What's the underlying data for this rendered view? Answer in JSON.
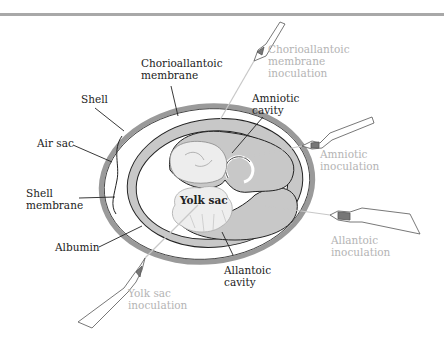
{
  "diagram": {
    "colors": {
      "shell": "#9a9a9a",
      "membrane_fill": "#c8c8c8",
      "outline": "#222222",
      "inoculation_label": "#b4b4b4",
      "structure_label": "#222222",
      "rule": "#a8a8a8"
    },
    "structure_labels": {
      "chorioallantoic_membrane": "Chorioallantoic\nmembrane",
      "shell": "Shell",
      "air_sac": "Air sac",
      "shell_membrane": "Shell\nmembrane",
      "albumin": "Albumin",
      "amniotic_cavity": "Amniotic\ncavity",
      "yolk_sac": "Yolk sac",
      "allantoic_cavity": "Allantoic\ncavity"
    },
    "inoculation_labels": {
      "chorioallantoic_membrane": "Chorioallantoic\nmembrane\ninoculation",
      "amniotic": "Amniotic\ninoculation",
      "allantoic": "Allantoic\ninoculation",
      "yolk_sac": "Yolk sac\ninoculation"
    },
    "syringe_icons": [
      "syringe-icon",
      "syringe-icon",
      "syringe-icon",
      "syringe-icon"
    ]
  }
}
